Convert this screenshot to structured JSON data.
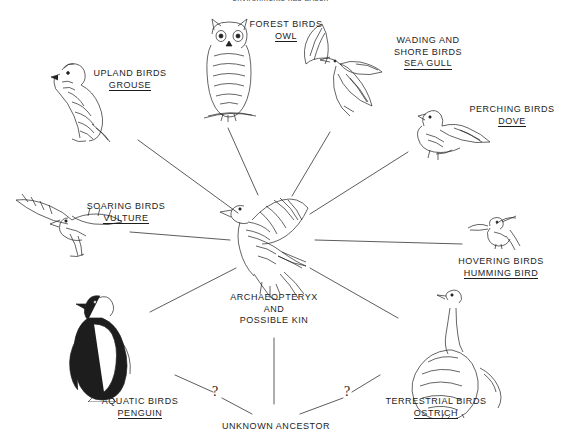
{
  "diagram": {
    "title_clipped": "environments has arisen",
    "center": {
      "name": "center-node",
      "line1": "ARCHAEOPTERYX",
      "line2": "AND",
      "line3": "POSSIBLE KIN",
      "illustration": "archaeopteryx-bird"
    },
    "ancestor": {
      "name": "unknown-ancestor",
      "label": "UNKNOWN ANCESTOR",
      "question_left": "?",
      "question_right": "?"
    },
    "branches": [
      {
        "id": "grouse",
        "group": "UPLAND BIRDS",
        "species": "GROUSE",
        "illustration": "grouse-bird"
      },
      {
        "id": "owl",
        "group": "FOREST BIRDS",
        "species": "OWL",
        "illustration": "owl-bird"
      },
      {
        "id": "seagull",
        "group_line1": "WADING AND",
        "group_line2": "SHORE BIRDS",
        "species": "SEA GULL",
        "illustration": "seagull-bird"
      },
      {
        "id": "dove",
        "group": "PERCHING BIRDS",
        "species": "DOVE",
        "illustration": "dove-bird"
      },
      {
        "id": "hummingbird",
        "group": "HOVERING BIRDS",
        "species": "HUMMING BIRD",
        "illustration": "hummingbird-bird"
      },
      {
        "id": "ostrich",
        "group": "TERRESTRIAL  BIRDS",
        "species": "OSTRICH",
        "illustration": "ostrich-bird"
      },
      {
        "id": "penguin",
        "group": "AQUATIC BIRDS",
        "species": "PENGUIN",
        "illustration": "penguin-bird"
      },
      {
        "id": "vulture",
        "group": "SOARING BIRDS",
        "species": "VULTURE",
        "illustration": "vulture-bird"
      }
    ],
    "colors": {
      "ink": "#1d1d1d",
      "background": "#ffffff",
      "line": "#3a3a3a"
    }
  }
}
